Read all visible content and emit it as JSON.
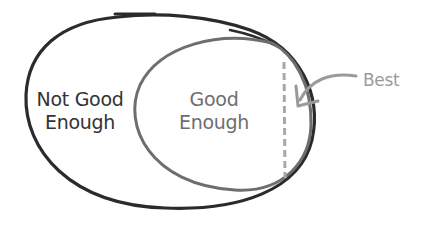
{
  "diagram": {
    "type": "nested-set",
    "outer_set": {
      "label": "Not Good Enough",
      "label_lines": [
        "Not Good",
        "Enough"
      ],
      "stroke_color": "#2b2b2b"
    },
    "inner_set": {
      "label": "Good Enough",
      "label_lines": [
        "Good",
        "Enough"
      ],
      "stroke_color": "#6e6e6e"
    },
    "boundary_marker": {
      "style": "dashed",
      "color": "#a8a8a8"
    },
    "annotation": {
      "label": "Best",
      "color": "#9a9a9a",
      "points_to": "right edge of Good Enough set beyond dashed line"
    }
  }
}
